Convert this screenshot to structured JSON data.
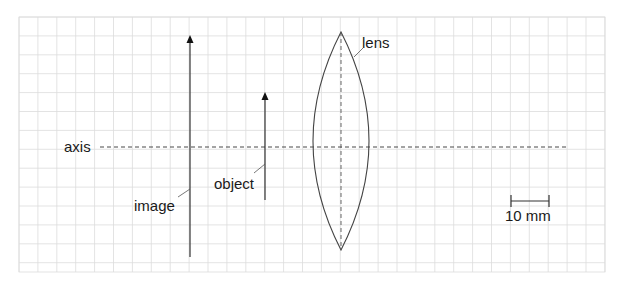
{
  "diagram": {
    "title": "",
    "grid": {
      "x0": 19,
      "y0": 17,
      "x1": 605,
      "y1": 272,
      "spacing": 18.9,
      "color": "#dcdcdc"
    },
    "colors": {
      "line": "#333333",
      "text": "#1a1a1a",
      "background": "#ffffff"
    },
    "labels": {
      "axis": "axis",
      "lens": "lens",
      "object": "object",
      "image": "image",
      "scale": "10 mm"
    },
    "elements": {
      "optical_axis": {
        "y": 147,
        "x_start": 100,
        "x_end": 568,
        "style": "dashed"
      },
      "image_arrow": {
        "x": 190,
        "y_base": 257,
        "y_tip": 35,
        "direction": "up"
      },
      "object_arrow": {
        "x": 265,
        "y_base": 200,
        "y_tip": 92,
        "direction": "up"
      },
      "lens": {
        "center_x": 341,
        "top_y": 32,
        "bottom_y": 250,
        "half_width": 28,
        "type": "biconvex",
        "center_line": "dashed"
      },
      "scale_bar": {
        "x_start": 511,
        "x_end": 549,
        "y": 201,
        "length_label": "10 mm"
      }
    }
  }
}
